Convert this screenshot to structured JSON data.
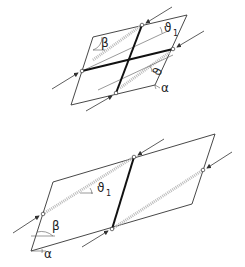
{
  "figure": {
    "panels": [
      {
        "id": "top",
        "description": "Parallelogram element with two crossing thick lines, loaded at four edge nodes",
        "labels": {
          "beta": "β",
          "theta": "ϑ",
          "theta_sub": "1",
          "theta2": "ϑ",
          "theta2_sub": "1",
          "alpha": "α"
        }
      },
      {
        "id": "bottom",
        "description": "Parallelogram element split by one thick line, loaded at four edge nodes",
        "labels": {
          "beta": "β",
          "theta": "ϑ",
          "theta_sub": "1",
          "alpha": "α"
        }
      }
    ]
  }
}
